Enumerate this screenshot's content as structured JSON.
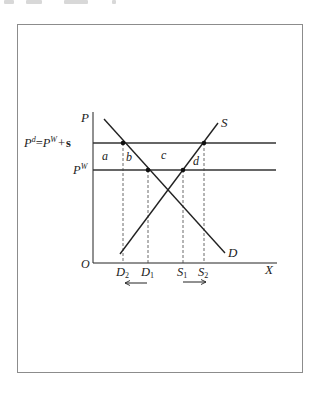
{
  "diagram": {
    "axes": {
      "y_label": "P",
      "x_label": "X",
      "origin_label": "O"
    },
    "price_levels": {
      "domestic_label_base": "P",
      "domestic_label_sup": "d",
      "domestic_label_eq": "=",
      "world_label_base": "P",
      "world_label_sup": "W",
      "plus": "+",
      "subsidy": "s",
      "world_only_base": "P",
      "world_only_sup": "W"
    },
    "curves": {
      "supply_label": "S",
      "demand_label": "D"
    },
    "areas": {
      "a": "a",
      "b": "b",
      "c": "c",
      "d": "d"
    },
    "quantities": [
      {
        "base": "D",
        "sub": "2"
      },
      {
        "base": "D",
        "sub": "1"
      },
      {
        "base": "S",
        "sub": "1"
      },
      {
        "base": "S",
        "sub": "2"
      }
    ],
    "arrows": {
      "demand_shift": "left",
      "supply_shift": "right"
    },
    "colors": {
      "line": "#222222",
      "guide": "#444444",
      "frame": "#8c8c8c"
    }
  }
}
